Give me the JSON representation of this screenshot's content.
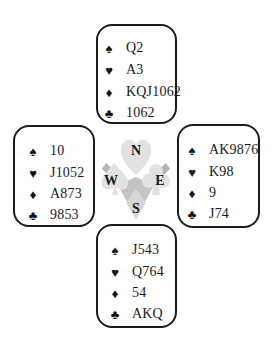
{
  "diagram": {
    "type": "bridge-deal",
    "compass": {
      "north_label": "N",
      "east_label": "E",
      "south_label": "S",
      "west_label": "W",
      "colors": {
        "light": "#e2e2e2",
        "dark": "#b3b3b3",
        "letters": "#1a1a1a"
      }
    },
    "suits": {
      "spades": "♠",
      "hearts": "♥",
      "diamonds": "♦",
      "clubs": "♣"
    },
    "hands": {
      "north": {
        "spades": "Q2",
        "hearts": "A3",
        "diamonds": "KQJ1062",
        "clubs": "1062"
      },
      "west": {
        "spades": "10",
        "hearts": "J1052",
        "diamonds": "A873",
        "clubs": "9853"
      },
      "east": {
        "spades": "AK9876",
        "hearts": "K98",
        "diamonds": "9",
        "clubs": "J74"
      },
      "south": {
        "spades": "J543",
        "hearts": "Q764",
        "diamonds": "54",
        "clubs": "AKQ"
      }
    }
  }
}
